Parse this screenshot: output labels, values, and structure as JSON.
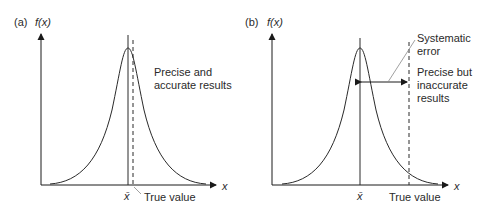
{
  "panels": [
    {
      "id": "a",
      "panel_label": "(a)",
      "y_axis_label": "f(x)",
      "x_axis_label": "x",
      "mean_label": "x̄",
      "true_value_label": "True value",
      "annotation_line1": "Precise and",
      "annotation_line2": "accurate results"
    },
    {
      "id": "b",
      "panel_label": "(b)",
      "y_axis_label": "f(x)",
      "x_axis_label": "x",
      "mean_label": "x̄",
      "true_value_label": "True value",
      "systematic_line1": "Systematic",
      "systematic_line2": "error",
      "annotation_line1": "Precise but",
      "annotation_line2": "inaccurate",
      "annotation_line3": "results"
    }
  ],
  "colors": {
    "stroke": "#2a2a2a",
    "leader": "#888888",
    "background": "#ffffff"
  }
}
